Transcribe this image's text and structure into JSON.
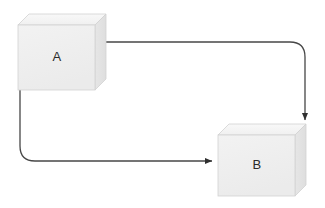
{
  "canvas": {
    "width": 325,
    "height": 208,
    "background": "#ffffff"
  },
  "diagram": {
    "type": "node-edge-diagram",
    "title": "",
    "style": {
      "node_shape": "3d-cube",
      "node_front_color": "#efefef",
      "node_top_color": "#f6f6f6",
      "node_side_color": "#e2e2e2",
      "node_outline_color": "#cfcfcf",
      "edge_color": "#474747",
      "edge_width": 1.3,
      "label_color": "#2b2b2b"
    },
    "nodes": [
      {
        "id": "A",
        "label": "A",
        "front": {
          "x": 18,
          "y": 25,
          "width": 77,
          "height": 65
        },
        "depth_x": 11,
        "depth_y": 11,
        "label_x": 57,
        "label_y": 58
      },
      {
        "id": "B",
        "label": "B",
        "front": {
          "x": 218,
          "y": 135,
          "width": 77,
          "height": 61
        },
        "depth_x": 11,
        "depth_y": 11,
        "label_x": 257,
        "label_y": 166
      }
    ],
    "edges": [
      {
        "id": "edge-a-top-to-b-top",
        "from": "A",
        "to": "B",
        "label": "",
        "arrowhead": "down",
        "path": "M 95 42 L 290 42 Q 305 42 305 57 L 305 120"
      },
      {
        "id": "edge-a-bottom-to-b-left",
        "from": "A",
        "to": "B",
        "label": "",
        "arrowhead": "right",
        "path": "M 20 90 L 20 146 Q 20 161 35 161 L 212 161"
      }
    ]
  }
}
